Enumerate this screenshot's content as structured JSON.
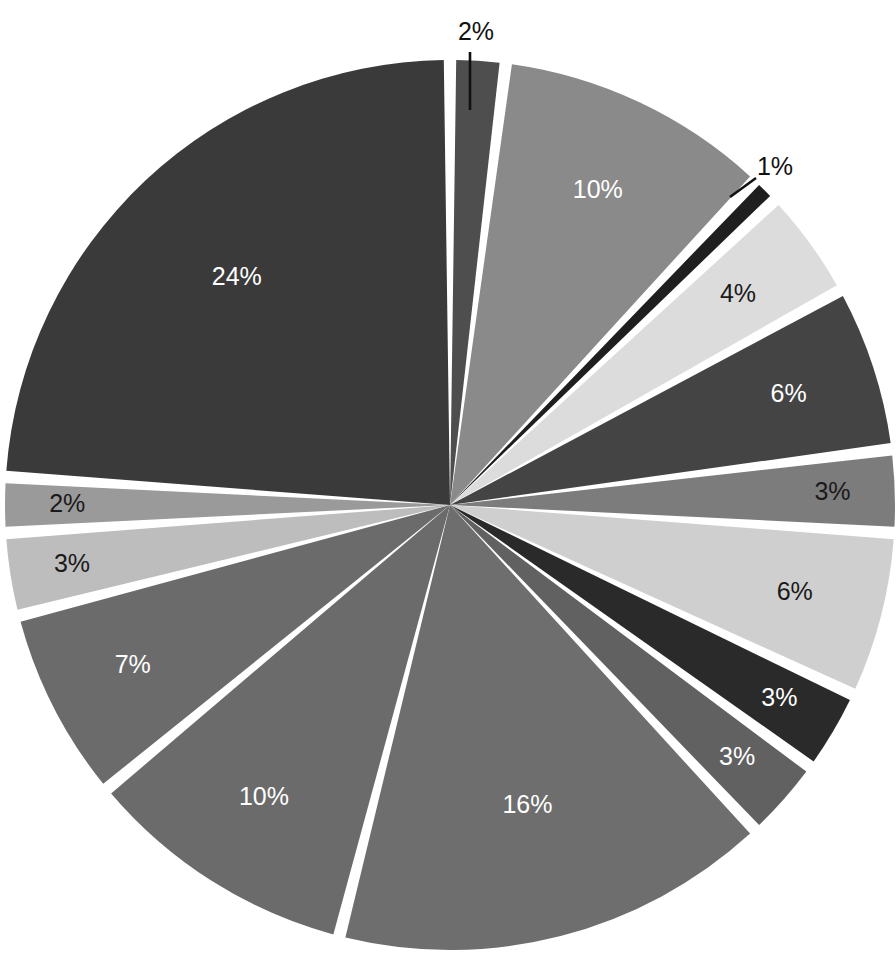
{
  "page": {
    "background_color": "#ffffff",
    "width": 896,
    "height": 977,
    "cropped_title_fragment": ""
  },
  "chart_data": {
    "type": "pie",
    "title": "",
    "subtitle": "",
    "xlabel": "",
    "ylabel": "",
    "legend_position": "none",
    "grid": false,
    "value_unit": "%",
    "label_format": "{value}%",
    "total": 100,
    "center": {
      "x": 450,
      "y": 505
    },
    "radius": 445,
    "explode_gap_degrees": 1.6,
    "slice_separator_color": "#ffffff",
    "categories": [
      "Slice 1",
      "Slice 2",
      "Slice 3",
      "Slice 4",
      "Slice 5",
      "Slice 6",
      "Slice 7",
      "Slice 8",
      "Slice 9",
      "Slice 10",
      "Slice 11",
      "Slice 12",
      "Slice 13",
      "Slice 14",
      "Slice 15"
    ],
    "values": [
      2,
      10,
      1,
      4,
      6,
      3,
      6,
      3,
      3,
      16,
      10,
      7,
      3,
      2,
      24
    ],
    "colors": [
      "#4e4e4e",
      "#8a8a8a",
      "#1f1f1f",
      "#dcdcdc",
      "#444444",
      "#7c7c7c",
      "#cfcfcf",
      "#2a2a2a",
      "#616161",
      "#6e6e6e",
      "#6b6b6b",
      "#6b6b6b",
      "#bdbdbd",
      "#9a9a9a",
      "#3a3a3a"
    ],
    "slices": [
      {
        "label": "2%",
        "value": 2,
        "color": "#4e4e4e",
        "label_color": "#111111",
        "label_placement": "callout",
        "label_on": "outside"
      },
      {
        "label": "10%",
        "value": 10,
        "color": "#8a8a8a",
        "label_color": "#ffffff",
        "label_placement": "inside",
        "label_on": "dark"
      },
      {
        "label": "1%",
        "value": 1,
        "color": "#1f1f1f",
        "label_color": "#111111",
        "label_placement": "callout",
        "label_on": "outside"
      },
      {
        "label": "4%",
        "value": 4,
        "color": "#dcdcdc",
        "label_color": "#111111",
        "label_placement": "inside",
        "label_on": "light"
      },
      {
        "label": "6%",
        "value": 6,
        "color": "#444444",
        "label_color": "#ffffff",
        "label_placement": "inside",
        "label_on": "dark"
      },
      {
        "label": "3%",
        "value": 3,
        "color": "#7c7c7c",
        "label_color": "#111111",
        "label_placement": "inside",
        "label_on": "light"
      },
      {
        "label": "6%",
        "value": 6,
        "color": "#cfcfcf",
        "label_color": "#111111",
        "label_placement": "inside",
        "label_on": "light"
      },
      {
        "label": "3%",
        "value": 3,
        "color": "#2a2a2a",
        "label_color": "#ffffff",
        "label_placement": "inside",
        "label_on": "dark"
      },
      {
        "label": "3%",
        "value": 3,
        "color": "#616161",
        "label_color": "#ffffff",
        "label_placement": "inside",
        "label_on": "dark"
      },
      {
        "label": "16%",
        "value": 16,
        "color": "#6e6e6e",
        "label_color": "#ffffff",
        "label_placement": "inside",
        "label_on": "dark"
      },
      {
        "label": "10%",
        "value": 10,
        "color": "#6b6b6b",
        "label_color": "#ffffff",
        "label_placement": "inside",
        "label_on": "dark"
      },
      {
        "label": "7%",
        "value": 7,
        "color": "#6b6b6b",
        "label_color": "#ffffff",
        "label_placement": "inside",
        "label_on": "dark"
      },
      {
        "label": "3%",
        "value": 3,
        "color": "#bdbdbd",
        "label_color": "#111111",
        "label_placement": "inside",
        "label_on": "light"
      },
      {
        "label": "2%",
        "value": 2,
        "color": "#9a9a9a",
        "label_color": "#111111",
        "label_placement": "inside",
        "label_on": "light"
      },
      {
        "label": "24%",
        "value": 24,
        "color": "#3a3a3a",
        "label_color": "#ffffff",
        "label_placement": "inside",
        "label_on": "dark"
      }
    ],
    "callouts": [
      {
        "label": "2%",
        "text_x": 476,
        "text_y": 33,
        "line_x1": 470,
        "line_y1": 52,
        "line_x2": 470,
        "line_y2": 110
      },
      {
        "label": "1%",
        "text_x": 775,
        "text_y": 168,
        "line_x1": 756,
        "line_y1": 178,
        "line_x2": 730,
        "line_y2": 197
      }
    ]
  }
}
